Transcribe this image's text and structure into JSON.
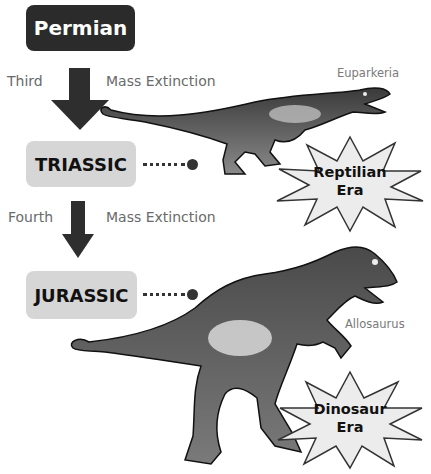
{
  "eras": [
    {
      "name": "Permian",
      "style": "dark"
    },
    {
      "name": "TRIASSIC",
      "style": "light"
    },
    {
      "name": "JURASSIC",
      "style": "light"
    }
  ],
  "transitions": [
    {
      "ordinal": "Third",
      "event": "Mass Extinction"
    },
    {
      "ordinal": "Fourth",
      "event": "Mass Extinction"
    }
  ],
  "species": [
    {
      "name": "Euparkeria",
      "era": "TRIASSIC"
    },
    {
      "name": "Allosaurus",
      "era": "JURASSIC"
    }
  ],
  "bursts": [
    {
      "line1": "Reptilian",
      "line2": "Era"
    },
    {
      "line1": "Dinosaur",
      "line2": "Era"
    }
  ],
  "colors": {
    "dark_box": "#2b2b2b",
    "light_box": "#d6d6d6",
    "label_text": "#6a6a6a",
    "arrow": "#2e2e2e",
    "burst_fill": "#ececec"
  }
}
